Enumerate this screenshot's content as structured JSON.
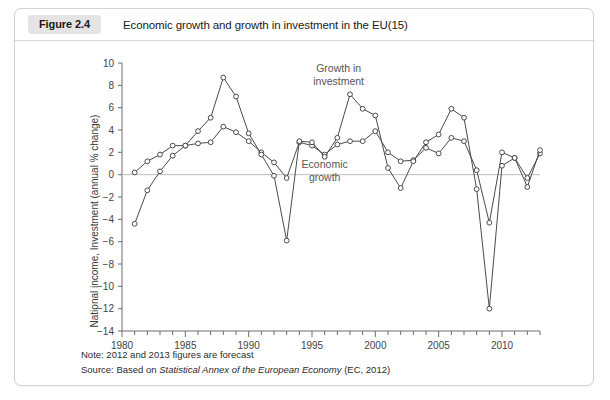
{
  "figure": {
    "badge": "Figure 2.4",
    "title": "Economic growth and growth in investment in the EU(15)"
  },
  "footer": {
    "note": "Note: 2012 and 2013 figures are forecast",
    "source_prefix": "Source: Based on ",
    "source_italic": "Statistical Annex of the European Economy",
    "source_suffix": " (EC, 2012)"
  },
  "chart_data": {
    "type": "line",
    "title": "Economic growth and growth in investment in the EU(15)",
    "xlabel": "",
    "ylabel": "National income, Investment (annual % change)",
    "xlim": [
      1980,
      2013
    ],
    "ylim": [
      -14,
      10
    ],
    "ytick_step": 2,
    "yticks": [
      10,
      8,
      6,
      4,
      2,
      0,
      -2,
      -4,
      -6,
      -8,
      -10,
      -12,
      -14
    ],
    "ytick_labels": [
      "10",
      "8",
      "6",
      "4",
      "2",
      "0",
      "-2",
      "-4",
      "-6",
      "-8",
      "-10",
      "-12",
      "-14"
    ],
    "xticks_major": [
      1980,
      1985,
      1990,
      1995,
      2000,
      2005,
      2010
    ],
    "xtick_labels": [
      "1980",
      "1985",
      "1990",
      "1995",
      "2000",
      "2005",
      "2010"
    ],
    "xtick_minor_step": 1,
    "grid": false,
    "legend": "inline-annotation",
    "annotations": [
      {
        "text_line1": "Growth in",
        "text_line2": "investment",
        "x": 1997.1,
        "y": 9.2
      },
      {
        "text_line1": "Economic",
        "text_line2": "growth",
        "x": 1996.0,
        "y": 0.6
      }
    ],
    "x": [
      1981,
      1982,
      1983,
      1984,
      1985,
      1986,
      1987,
      1988,
      1989,
      1990,
      1991,
      1992,
      1993,
      1994,
      1995,
      1996,
      1997,
      1998,
      1999,
      2000,
      2001,
      2002,
      2003,
      2004,
      2005,
      2006,
      2007,
      2008,
      2009,
      2010,
      2011,
      2012,
      2013
    ],
    "series": [
      {
        "name": "Economic growth",
        "marker": "circle-open",
        "color": "#4a4a4a",
        "values": [
          0.2,
          1.2,
          1.8,
          2.6,
          2.6,
          2.8,
          2.9,
          4.3,
          3.8,
          3.0,
          2.0,
          1.1,
          -0.3,
          2.9,
          2.6,
          1.8,
          2.7,
          3.0,
          3.0,
          3.9,
          2.0,
          1.2,
          1.3,
          2.4,
          1.9,
          3.3,
          3.0,
          0.4,
          -4.3,
          2.0,
          1.5,
          -0.3,
          1.9
        ]
      },
      {
        "name": "Growth in investment",
        "marker": "circle-open",
        "color": "#4a4a4a",
        "values": [
          -4.4,
          -1.4,
          0.3,
          1.7,
          2.6,
          3.9,
          5.1,
          8.7,
          7.0,
          3.7,
          1.8,
          -0.1,
          -5.9,
          3.0,
          2.9,
          1.6,
          3.3,
          7.2,
          5.9,
          5.3,
          0.6,
          -1.2,
          1.2,
          2.9,
          3.6,
          5.9,
          5.1,
          -1.3,
          -12.0,
          0.8,
          1.5,
          -1.1,
          2.2
        ]
      }
    ]
  }
}
